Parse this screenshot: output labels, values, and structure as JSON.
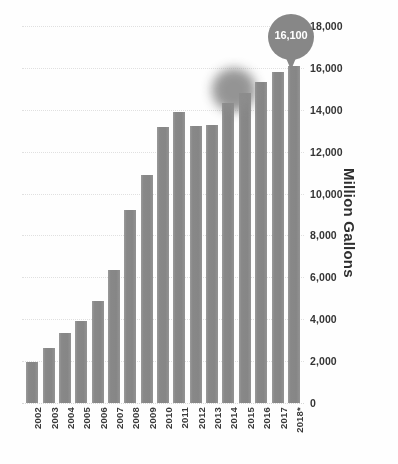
{
  "chart_data": {
    "type": "bar",
    "title": "",
    "subtitle": "",
    "xlabel": "",
    "ylabel": "Million Gallons",
    "ylim": [
      0,
      18000
    ],
    "ytick_values": [
      18000,
      16000,
      14000,
      12000,
      10000,
      8000,
      6000,
      4000,
      2000,
      0
    ],
    "ytick_labels": [
      "18,000",
      "16,000",
      "14,000",
      "12,000",
      "10,000",
      "8,000",
      "6,000",
      "4,000",
      "2,000",
      "0"
    ],
    "y_axis_position": "right",
    "grid": true,
    "grid_style": "dotted-horizontal",
    "legend": false,
    "legend_position": "none",
    "bar_color": "#8b8b8b",
    "background_color": "#ffffff",
    "categories": [
      "2002",
      "2003",
      "2004",
      "2005",
      "2006",
      "2007",
      "2008",
      "2009",
      "2010",
      "2011",
      "2012",
      "2013",
      "2014",
      "2015",
      "2016",
      "2017",
      "2018*"
    ],
    "values": [
      1980,
      2620,
      3320,
      3920,
      4860,
      6340,
      9230,
      10870,
      13200,
      13890,
      13210,
      13290,
      14330,
      14790,
      15350,
      15800,
      16100
    ],
    "annotations": [
      {
        "name": "value-callout",
        "label": "16,100",
        "attached_to_category": "2018*",
        "shape": "map-pin",
        "color": "#878787",
        "text_color": "#ffffff"
      },
      {
        "name": "blurred-marker",
        "label": "",
        "attached_to_category": "2014",
        "shape": "circle",
        "color": "#8d8d8d",
        "blurred": true
      }
    ],
    "footnote": "*"
  },
  "axis": {
    "y_title": "Million Gallons"
  },
  "caption": {
    "clipped_text": ""
  }
}
